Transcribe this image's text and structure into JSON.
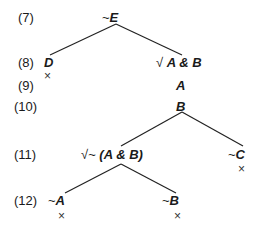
{
  "rows": [
    {
      "label": "(7)"
    },
    {
      "label": "(8)"
    },
    {
      "label": "(9)"
    },
    {
      "label": "(10)"
    },
    {
      "label": "(11)"
    },
    {
      "label": "(12)"
    }
  ],
  "nodes": {
    "notE": {
      "prefix": "~",
      "text": "E"
    },
    "D": {
      "prefix": "",
      "text": "D"
    },
    "AandB": {
      "prefix": "√",
      "text": "A & B"
    },
    "A": {
      "prefix": "",
      "text": "A"
    },
    "B": {
      "prefix": "",
      "text": "B"
    },
    "notAandB": {
      "prefix": "√~",
      "text": "(A & B)"
    },
    "notC": {
      "prefix": "~",
      "text": "C"
    },
    "notA": {
      "prefix": "~",
      "text": "A"
    },
    "notB": {
      "prefix": "~",
      "text": "B"
    }
  },
  "closed_mark": "×"
}
